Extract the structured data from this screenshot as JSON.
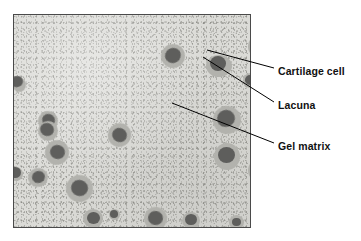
{
  "figure": {
    "kind": "histology-micrograph-diagram"
  },
  "panel": {
    "name": "micrograph-panel",
    "x": 13,
    "y": 14,
    "width": 238,
    "height": 214,
    "border_color": "#4a4a4a",
    "matrix_color": "#dcdcd8",
    "lacuna_color": "#b2b2ad",
    "cell_color": "#5e5e5c"
  },
  "labels": [
    {
      "id": "cartilage-cell",
      "text": "Cartilage cell",
      "x": 278,
      "y": 65,
      "leader": {
        "x1": 274,
        "y1": 68,
        "x2": 207,
        "y2": 50
      }
    },
    {
      "id": "lacuna",
      "text": "Lacuna",
      "x": 278,
      "y": 99,
      "leader": {
        "x1": 274,
        "y1": 102,
        "x2": 203,
        "y2": 57
      }
    },
    {
      "id": "gel-matrix",
      "text": "Gel matrix",
      "x": 278,
      "y": 140,
      "leader": {
        "x1": 274,
        "y1": 143,
        "x2": 172,
        "y2": 103
      }
    }
  ],
  "cells": [
    {
      "id": "cell-1",
      "cx": 3,
      "cy": 67,
      "r": 6.0,
      "lx": -2,
      "ly": 62,
      "lw": 14,
      "lh": 15,
      "rot": -20
    },
    {
      "id": "cell-2",
      "cx": 34,
      "cy": 105,
      "r": 6.5,
      "lx": 24,
      "ly": 96,
      "lw": 20,
      "lh": 20,
      "rot": 25
    },
    {
      "id": "cell-3",
      "cx": 33,
      "cy": 115,
      "r": 7.0,
      "lx": 24,
      "ly": 106,
      "lw": 20,
      "lh": 20,
      "rot": 25
    },
    {
      "id": "cell-4",
      "cx": 43,
      "cy": 137,
      "r": 7.5,
      "lx": 31,
      "ly": 125,
      "lw": 24,
      "lh": 25,
      "rot": 15
    },
    {
      "id": "cell-5",
      "cx": 1,
      "cy": 158,
      "r": 6.0,
      "lx": -5,
      "ly": 152,
      "lw": 14,
      "lh": 14,
      "rot": 0
    },
    {
      "id": "cell-6",
      "cx": 24,
      "cy": 162,
      "r": 6.5,
      "lx": 14,
      "ly": 153,
      "lw": 20,
      "lh": 19,
      "rot": -15
    },
    {
      "id": "cell-7",
      "cx": 65,
      "cy": 173,
      "r": 8.5,
      "lx": 52,
      "ly": 160,
      "lw": 27,
      "lh": 27,
      "rot": 20
    },
    {
      "id": "cell-8",
      "cx": 79,
      "cy": 203,
      "r": 6.5,
      "lx": 69,
      "ly": 194,
      "lw": 20,
      "lh": 19,
      "rot": 0
    },
    {
      "id": "cell-9",
      "cx": 105,
      "cy": 120,
      "r": 7.5,
      "lx": 94,
      "ly": 108,
      "lw": 23,
      "lh": 24,
      "rot": 30
    },
    {
      "id": "cell-10",
      "cx": 141,
      "cy": 203,
      "r": 7.5,
      "lx": 130,
      "ly": 192,
      "lw": 23,
      "lh": 23,
      "rot": 10
    },
    {
      "id": "cell-11",
      "cx": 159,
      "cy": 41,
      "r": 8.0,
      "lx": 147,
      "ly": 29,
      "lw": 24,
      "lh": 24,
      "rot": -25
    },
    {
      "id": "cell-12",
      "cx": 204,
      "cy": 49,
      "r": 8.0,
      "lx": 192,
      "ly": 40,
      "lw": 26,
      "lh": 22,
      "rot": 0
    },
    {
      "id": "cell-13",
      "cx": 236,
      "cy": 65,
      "r": 5.0,
      "lx": 229,
      "ly": 58,
      "lw": 15,
      "lh": 15,
      "rot": 0
    },
    {
      "id": "cell-14",
      "cx": 212,
      "cy": 104,
      "r": 9.0,
      "lx": 199,
      "ly": 91,
      "lw": 28,
      "lh": 28,
      "rot": -20
    },
    {
      "id": "cell-15",
      "cx": 212,
      "cy": 140,
      "r": 8.5,
      "lx": 200,
      "ly": 128,
      "lw": 26,
      "lh": 27,
      "rot": 0
    },
    {
      "id": "cell-16",
      "cx": 245,
      "cy": 31,
      "r": 8.0,
      "lx": 234,
      "ly": 20,
      "lw": 23,
      "lh": 23,
      "rot": 0
    },
    {
      "id": "cell-17",
      "cx": 245,
      "cy": 155,
      "r": 8.0,
      "lx": 234,
      "ly": 144,
      "lw": 23,
      "lh": 23,
      "rot": 0
    },
    {
      "id": "cell-18",
      "cx": 177,
      "cy": 205,
      "r": 6.0,
      "lx": 168,
      "ly": 197,
      "lw": 18,
      "lh": 17,
      "rot": 0
    },
    {
      "id": "cell-19",
      "cx": 222,
      "cy": 207,
      "r": 4.5,
      "lx": 215,
      "ly": 200,
      "lw": 15,
      "lh": 15,
      "rot": 0
    },
    {
      "id": "cell-20",
      "cx": 100,
      "cy": 199,
      "r": 4.0,
      "lx": 95,
      "ly": 194,
      "lw": 11,
      "lh": 11,
      "rot": 0
    }
  ]
}
